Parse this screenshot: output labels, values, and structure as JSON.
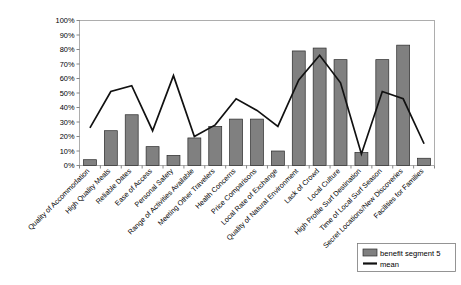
{
  "chart_data": {
    "type": "bar",
    "title": "",
    "subtitle": "",
    "xlabel": "",
    "ylabel": "",
    "ylim": [
      0,
      100
    ],
    "grid": false,
    "legend_position": "bottom-right",
    "ytick_labels": [
      "100%",
      "90%",
      "80%",
      "70%",
      "60%",
      "50%",
      "40%",
      "30%",
      "20%",
      "10%",
      "0%"
    ],
    "ytick_values": [
      100,
      90,
      80,
      70,
      60,
      50,
      40,
      30,
      20,
      10,
      0
    ],
    "categories": [
      "Quality of Accommodation",
      "High Quality Meals",
      "Reliable Dates",
      "Ease of Access",
      "Personal Safety",
      "Range of Activities Available",
      "Meeting Other Travelers",
      "Health Concerns",
      "Price Comparisons",
      "Local Rate of Exchange",
      "Quality of Natural Environment",
      "Lack of Crowd",
      "Local Culture",
      "High Profile Surf Destination",
      "Time of Local Surf Season",
      "Secret Locations/New Discoveries",
      "Facilities for Families"
    ],
    "series": [
      {
        "name": "benefit segment 5",
        "type": "bar",
        "color": "#808080",
        "values": [
          4,
          24,
          35,
          13,
          7,
          19,
          27,
          32,
          32,
          10,
          79,
          81,
          73,
          9,
          73,
          83,
          5
        ]
      },
      {
        "name": "mean",
        "type": "line",
        "color": "#111111",
        "values": [
          26,
          51,
          55,
          24,
          62,
          20,
          28,
          46,
          38,
          27,
          59,
          76,
          57,
          8,
          51,
          46,
          15
        ]
      }
    ]
  },
  "legend": {
    "items": [
      {
        "label": "benefit segment 5",
        "marker": "swatch"
      },
      {
        "label": "mean",
        "marker": "line"
      }
    ]
  }
}
